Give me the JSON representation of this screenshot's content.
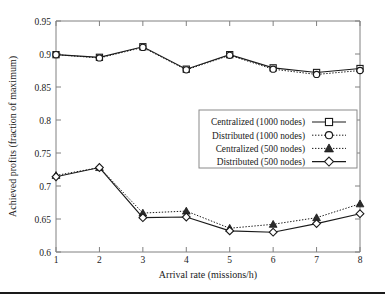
{
  "chart_data": {
    "type": "line",
    "title": "",
    "xlabel": "Arrival rate (missions/h)",
    "ylabel": "Achieved profits (fraction of maximum)",
    "x": [
      1,
      2,
      3,
      4,
      5,
      6,
      7,
      8
    ],
    "xlim": [
      1,
      8
    ],
    "ylim": [
      0.6,
      0.95
    ],
    "xticks": [
      "1",
      "2",
      "3",
      "4",
      "5",
      "6",
      "7",
      "8"
    ],
    "yticks": [
      "0.6",
      "0.65",
      "0.7",
      "0.75",
      "0.8",
      "0.85",
      "0.9",
      "0.95"
    ],
    "grid": false,
    "legend_position": "center-right",
    "series": [
      {
        "name": "Centralized (1000 nodes)",
        "marker": "square-open",
        "linestyle": "solid",
        "color": "#1a1a1a",
        "values": [
          0.899,
          0.895,
          0.911,
          0.877,
          0.899,
          0.879,
          0.872,
          0.878
        ]
      },
      {
        "name": "Distributed (1000 nodes)",
        "marker": "circle-open",
        "linestyle": "dotted",
        "color": "#1a1a1a",
        "values": [
          0.899,
          0.894,
          0.91,
          0.876,
          0.898,
          0.877,
          0.869,
          0.875
        ]
      },
      {
        "name": "Centralized (500 nodes)",
        "marker": "triangle-filled",
        "linestyle": "dotted",
        "color": "#1a1a1a",
        "values": [
          0.716,
          0.728,
          0.659,
          0.662,
          0.636,
          0.642,
          0.652,
          0.673
        ]
      },
      {
        "name": "Distributed (500 nodes)",
        "marker": "diamond-open",
        "linestyle": "solid",
        "color": "#1a1a1a",
        "values": [
          0.714,
          0.728,
          0.652,
          0.653,
          0.632,
          0.63,
          0.643,
          0.658
        ]
      }
    ]
  }
}
